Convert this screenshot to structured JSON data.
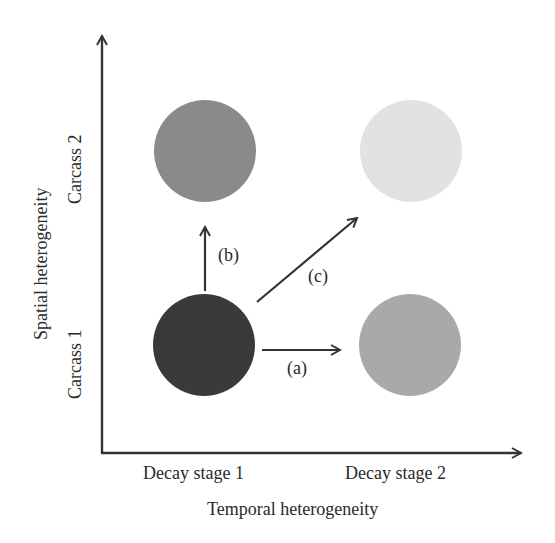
{
  "diagram": {
    "x_axis": {
      "title": "Temporal heterogeneity",
      "categories": [
        "Decay stage 1",
        "Decay stage 2"
      ]
    },
    "y_axis": {
      "title": "Spatial heterogeneity",
      "categories": [
        "Carcass 1",
        "Carcass 2"
      ]
    },
    "nodes": [
      {
        "id": "carcass1-stage1",
        "x": "Decay stage 1",
        "y": "Carcass 1",
        "color": "#3a3a3a"
      },
      {
        "id": "carcass2-stage1",
        "x": "Decay stage 1",
        "y": "Carcass 2",
        "color": "#8a8a8a"
      },
      {
        "id": "carcass1-stage2",
        "x": "Decay stage 2",
        "y": "Carcass 1",
        "color": "#a9a9a9"
      },
      {
        "id": "carcass2-stage2",
        "x": "Decay stage 2",
        "y": "Carcass 2",
        "color": "#e2e2e2"
      }
    ],
    "arrows": [
      {
        "label": "(a)",
        "from": "carcass1-stage1",
        "to": "carcass1-stage2"
      },
      {
        "label": "(b)",
        "from": "carcass1-stage1",
        "to": "carcass2-stage1"
      },
      {
        "label": "(c)",
        "from": "carcass1-stage1",
        "to": "carcass2-stage2"
      }
    ]
  }
}
